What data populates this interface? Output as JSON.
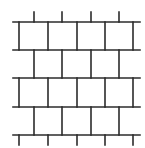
{
  "diagram": {
    "title": "",
    "type": "running-bond brick grid",
    "stroke_color": "#2b2b2b",
    "stroke_width": 1.6,
    "horizontal_lines": [
      {
        "y": 22,
        "x1": 13,
        "x2": 140
      },
      {
        "y": 50,
        "x1": 13,
        "x2": 140
      },
      {
        "y": 78,
        "x1": 13,
        "x2": 140
      },
      {
        "y": 107,
        "x1": 13,
        "x2": 140
      },
      {
        "y": 135,
        "x1": 13,
        "x2": 140
      }
    ],
    "vertical_segments": [
      {
        "x": 34,
        "y1": 12,
        "y2": 22
      },
      {
        "x": 62,
        "y1": 12,
        "y2": 22
      },
      {
        "x": 91,
        "y1": 12,
        "y2": 22
      },
      {
        "x": 119,
        "y1": 12,
        "y2": 22
      },
      {
        "x": 19,
        "y1": 22,
        "y2": 50
      },
      {
        "x": 48,
        "y1": 22,
        "y2": 50
      },
      {
        "x": 77,
        "y1": 22,
        "y2": 50
      },
      {
        "x": 105,
        "y1": 22,
        "y2": 50
      },
      {
        "x": 133,
        "y1": 22,
        "y2": 50
      },
      {
        "x": 34,
        "y1": 50,
        "y2": 78
      },
      {
        "x": 62,
        "y1": 50,
        "y2": 78
      },
      {
        "x": 91,
        "y1": 50,
        "y2": 78
      },
      {
        "x": 119,
        "y1": 50,
        "y2": 78
      },
      {
        "x": 19,
        "y1": 78,
        "y2": 107
      },
      {
        "x": 48,
        "y1": 78,
        "y2": 107
      },
      {
        "x": 77,
        "y1": 78,
        "y2": 107
      },
      {
        "x": 105,
        "y1": 78,
        "y2": 107
      },
      {
        "x": 133,
        "y1": 78,
        "y2": 107
      },
      {
        "x": 34,
        "y1": 107,
        "y2": 135
      },
      {
        "x": 62,
        "y1": 107,
        "y2": 135
      },
      {
        "x": 91,
        "y1": 107,
        "y2": 135
      },
      {
        "x": 119,
        "y1": 107,
        "y2": 135
      },
      {
        "x": 19,
        "y1": 135,
        "y2": 145
      },
      {
        "x": 48,
        "y1": 135,
        "y2": 145
      },
      {
        "x": 77,
        "y1": 135,
        "y2": 145
      },
      {
        "x": 105,
        "y1": 135,
        "y2": 145
      },
      {
        "x": 133,
        "y1": 135,
        "y2": 145
      }
    ]
  }
}
